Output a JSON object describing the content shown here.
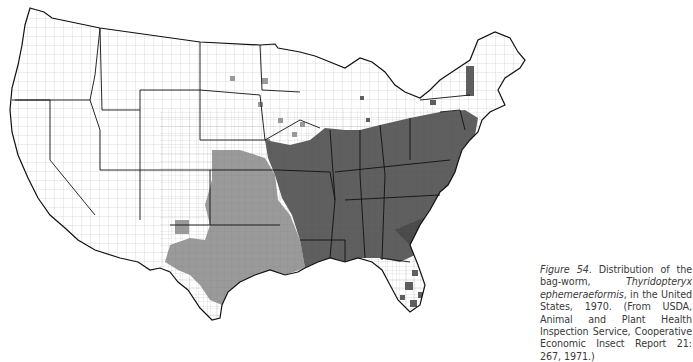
{
  "figure": {
    "label": "Figure 54",
    "caption_lead": ". Distribution of the bag-worm, ",
    "species": "Thyridopteryx ephemeraeformis",
    "caption_mid": ", in the United States, 1970. ",
    "source": "(From USDA, Animal and Plant Health Inspection Service, Cooperative Economic Insect Report 21: 267, 1971.)"
  },
  "map": {
    "subject": "county-level distribution map of the contiguous United States",
    "year": "1970",
    "colors": {
      "background": "#ffffff",
      "unshaded_county": "#ffffff",
      "light_shading": "#9a9a9a",
      "dark_shading": "#5a5a5a",
      "state_border": "#111111",
      "county_border": "#555555"
    },
    "legend": []
  }
}
